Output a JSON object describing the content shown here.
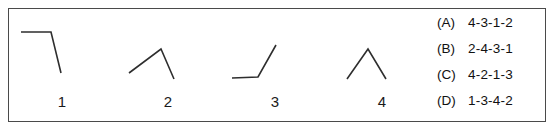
{
  "panel": {
    "border_color": "#4a4a4a",
    "background": "#ffffff",
    "stroke_color": "#2e2e2e"
  },
  "figures": [
    {
      "label": "1",
      "name": "figure-1",
      "description": "flat segment then sharp drop",
      "points": "12,23 42,23 52,64"
    },
    {
      "label": "2",
      "name": "figure-2",
      "description": "rise to peak then steeper fall",
      "points": "14,64 46,40 59,70"
    },
    {
      "label": "3",
      "name": "figure-3",
      "description": "flat segment then steep rise",
      "points": "10,69 36,68 54,36"
    },
    {
      "label": "4",
      "name": "figure-4",
      "description": "symmetric peak up then down",
      "points": "18,70 39,40 57,70"
    }
  ],
  "options": [
    {
      "letter": "(A)",
      "value": "4-3-1-2"
    },
    {
      "letter": "(B)",
      "value": "2-4-3-1"
    },
    {
      "letter": "(C)",
      "value": "4-2-1-3"
    },
    {
      "letter": "(D)",
      "value": "1-3-4-2"
    }
  ]
}
